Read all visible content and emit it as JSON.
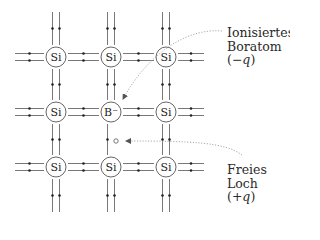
{
  "diagram": {
    "colors": {
      "bond": "#555555",
      "atom_outline": "#555555",
      "annotation_arrow": "#9a9a9a",
      "text": "#2a2a2a"
    },
    "lattice": {
      "columns_x": [
        56,
        111,
        166
      ],
      "rows_y": [
        57,
        112,
        167
      ],
      "atom_radius": 10,
      "atoms": [
        {
          "row": 0,
          "col": 0,
          "label": "Si"
        },
        {
          "row": 0,
          "col": 1,
          "label": "Si"
        },
        {
          "row": 0,
          "col": 2,
          "label": "Si"
        },
        {
          "row": 1,
          "col": 0,
          "label": "Si"
        },
        {
          "row": 1,
          "col": 1,
          "label": "B⁻"
        },
        {
          "row": 1,
          "col": 2,
          "label": "Si"
        },
        {
          "row": 2,
          "col": 0,
          "label": "Si"
        },
        {
          "row": 2,
          "col": 1,
          "label": "Si"
        },
        {
          "row": 2,
          "col": 2,
          "label": "Si"
        }
      ],
      "missing_bond_note": "Below B⁻ only one vertical bond line (one electron missing = hole)"
    },
    "annotations": {
      "boron": {
        "line1": "Ionisiertes",
        "line2": "Boratom",
        "charge_open": "(−",
        "charge_var": "q",
        "charge_close": ")"
      },
      "hole": {
        "line1": "Freies",
        "line2": "Loch",
        "charge_open": "(+",
        "charge_var": "q",
        "charge_close": ")"
      }
    }
  }
}
